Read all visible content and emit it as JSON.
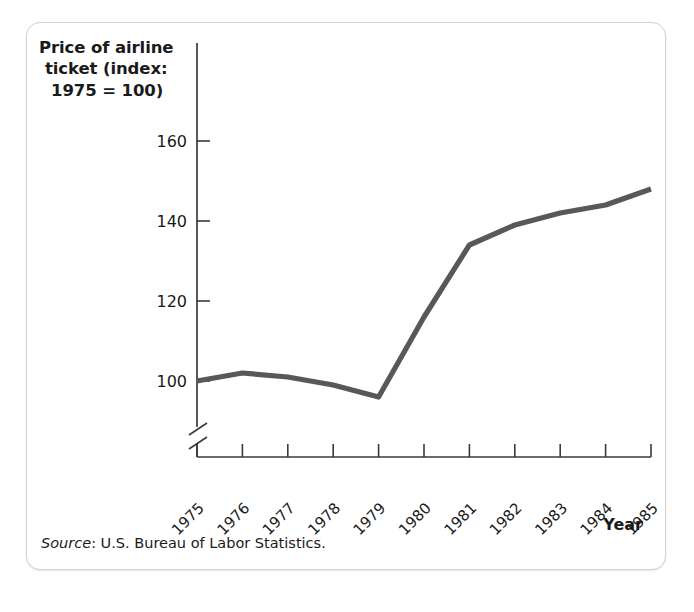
{
  "figure": {
    "title_lines": [
      "Price of airline",
      "ticket (index:",
      "1975 = 100)"
    ],
    "x_axis_title": "Year",
    "source_label": "Source",
    "source_text": ": U.S. Bureau of Labor Statistics.",
    "line_color": "#585858",
    "axis_color": "#3a3a3a",
    "text_color": "#1a1a1a",
    "card_background": "#ffffff",
    "card_border_color": "#d2d2d2"
  },
  "chart_data": {
    "type": "line",
    "title": "Price of airline ticket (index: 1975 = 100)",
    "xlabel": "Year",
    "ylabel": "Price of airline ticket (index: 1975 = 100)",
    "categories": [
      "1975",
      "1976",
      "1977",
      "1978",
      "1979",
      "1980",
      "1981",
      "1982",
      "1983",
      "1984",
      "1985"
    ],
    "x": [
      1975,
      1976,
      1977,
      1978,
      1979,
      1980,
      1981,
      1982,
      1983,
      1984,
      1985
    ],
    "values": [
      100,
      102,
      101,
      99,
      96,
      116,
      134,
      139,
      142,
      144,
      148
    ],
    "yticks": [
      100,
      120,
      140,
      160
    ],
    "ytick_labels": [
      "100",
      "120",
      "140",
      "160"
    ],
    "ylim": [
      94,
      166
    ],
    "xlim": [
      1975,
      1985
    ],
    "axis_break": true,
    "axis_break_axis": "y",
    "grid": false,
    "legend": false,
    "legend_position": "none",
    "annotations": [
      "Source: U.S. Bureau of Labor Statistics."
    ]
  }
}
